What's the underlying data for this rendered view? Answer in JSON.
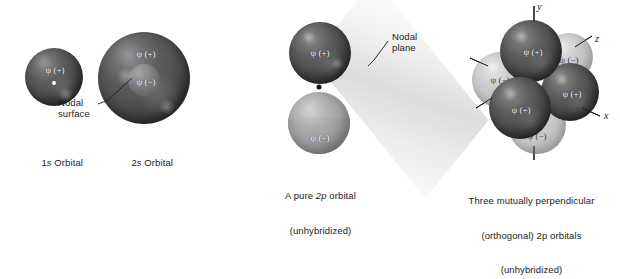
{
  "figure": {
    "background_color": "#ffffff",
    "ink_color": "#1d1d1d"
  },
  "panels": {
    "one_s": {
      "caption_leading": "1",
      "caption_italic": "s",
      "caption_trailing": " Orbital",
      "psi_plus": "ψ (+)",
      "nucleus_name": "nucleus-dot"
    },
    "two_s": {
      "caption_leading": "2",
      "caption_italic": "s",
      "caption_trailing": " Orbital",
      "psi_plus": "ψ (+)",
      "psi_minus": "ψ (−)",
      "annotation_line1": "Nodal",
      "annotation_line2": "surface"
    },
    "two_p": {
      "caption_line1_leading": "A pure ",
      "caption_line1_italic": "2p",
      "caption_line1_trailing": " orbital",
      "caption_line2": "(unhybridized)",
      "psi_plus": "ψ (+)",
      "psi_minus": "ψ (−)",
      "annotation_line1": "Nodal",
      "annotation_line2": "plane"
    },
    "three_p": {
      "caption_line1": "Three mutually perpendicular",
      "caption_line2": "(orthogonal) 2p orbitals",
      "caption_line3": "(unhybridized)",
      "axis_y": "y",
      "axis_z": "z",
      "axis_x": "x",
      "lobes": [
        {
          "sign": "ψ (+)",
          "position": "top"
        },
        {
          "sign": "ψ (−)",
          "position": "bottom"
        },
        {
          "sign": "ψ (−)",
          "position": "left"
        },
        {
          "sign": "ψ (+)",
          "position": "right"
        },
        {
          "sign": "ψ (+)",
          "position": "front-lower-left"
        },
        {
          "sign": "ψ (−)",
          "position": "back-upper-right"
        }
      ]
    }
  },
  "colors": {
    "positive_lobe": "#4a4a4a",
    "negative_lobe": "#bdbdbd",
    "plane": "#e4e4e4",
    "axis": "#1a1a1a"
  }
}
